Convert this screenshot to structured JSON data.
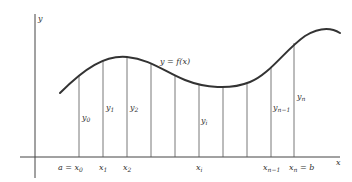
{
  "diagram": {
    "type": "riemann-ordinates",
    "curve_label": "y = f(x)",
    "axis_labels": {
      "x": "x",
      "y": "y"
    },
    "x_tick_labels": [
      {
        "main": "a = x",
        "sub": "0"
      },
      {
        "main": "x",
        "sub": "1"
      },
      {
        "main": "x",
        "sub": "2"
      },
      {
        "main": "x",
        "sub": "i"
      },
      {
        "main": "x",
        "sub": "n−1"
      },
      {
        "main": "x",
        "sub": "n",
        "suffix": " = b"
      }
    ],
    "ordinate_labels": [
      {
        "main": "y",
        "sub": "0"
      },
      {
        "main": "y",
        "sub": "1"
      },
      {
        "main": "y",
        "sub": "2"
      },
      {
        "main": "y",
        "sub": "i"
      },
      {
        "main": "y",
        "sub": "n−1"
      },
      {
        "main": "y",
        "sub": "n"
      }
    ],
    "colors": {
      "stroke": "#333333",
      "background": "#ffffff"
    }
  }
}
